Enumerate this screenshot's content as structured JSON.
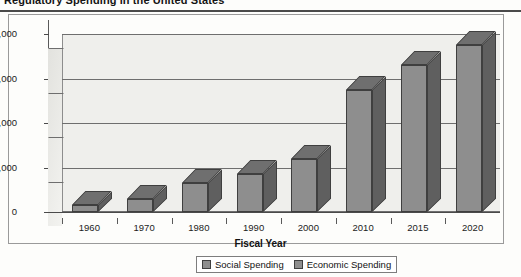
{
  "document": {
    "title": "Regulatory Spending in the United States",
    "title_clipped": true,
    "ghost_text": {
      "line1": "U.S. Self Regulation",
      "line2": "of Research",
      "line3": "and the role of the",
      "line4": "Institutional Review",
      "line5": "Board in protecting human",
      "line6": "subjects in the United States"
    }
  },
  "chart_data": {
    "type": "bar",
    "title": "Regulatory Spending in the United States",
    "xlabel": "Fiscal Year",
    "ylabel": "",
    "categories": [
      "1960",
      "1970",
      "1980",
      "1990",
      "2000",
      "2010",
      "2015",
      "2020"
    ],
    "series": [
      {
        "name": "Social Spending",
        "values": [
          3000,
          6000,
          13000,
          17000,
          24000,
          55000,
          66000,
          75000
        ]
      }
    ],
    "legend": [
      "Social Spending",
      "Economic Spending"
    ],
    "legend_position": "bottom",
    "ylim": [
      0,
      80000
    ],
    "yticks": [
      "0",
      "20,000",
      "40,000",
      "60,000",
      "80,000"
    ],
    "ytick_values": [
      0,
      20000,
      40000,
      60000,
      80000
    ],
    "grid": true,
    "style": "3d-column",
    "colors": {
      "bar_front": "#8e8e8e",
      "bar_top": "#6f6f6f",
      "bar_side": "#5f5f5f",
      "plot_background": "#efefec",
      "gridline": "#6e6e6e",
      "axis": "#4a4a4a",
      "text": "#1a1a1a"
    }
  }
}
